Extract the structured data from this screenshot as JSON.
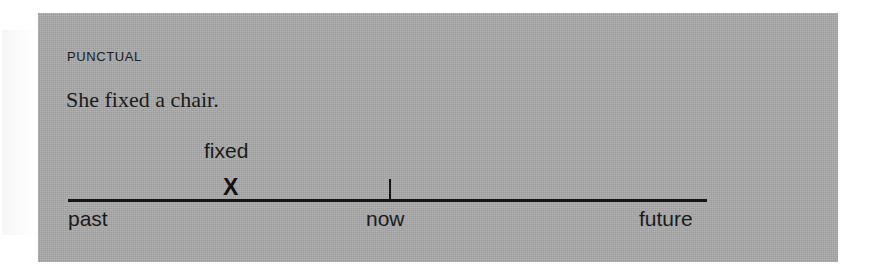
{
  "figure": {
    "aspect_label": "Punctual",
    "example_sentence": "She fixed a chair.",
    "panel_color": "#a9a9a9",
    "ink_color": "#1b1b1b"
  },
  "timeline": {
    "axis": {
      "captions": [
        {
          "id": "past",
          "label": "past"
        },
        {
          "id": "now",
          "label": "now"
        },
        {
          "id": "future",
          "label": "future"
        }
      ],
      "now_tick": true
    },
    "events": [
      {
        "id": "fixed",
        "verb_label": "fixed",
        "marker_glyph": "X",
        "marker_kind": "punctual-point",
        "region": "past"
      }
    ]
  },
  "chart_data": {
    "type": "scatter",
    "title": "Punctual",
    "subtitle": "She fixed a chair.",
    "xlabel": "",
    "ylabel": "",
    "grid": false,
    "legend": null,
    "x_axis": {
      "kind": "timeline",
      "tick_labels": [
        "past",
        "now",
        "future"
      ],
      "tick_positions": [
        0.0,
        0.5,
        1.0
      ],
      "marked_ticks": [
        "now"
      ]
    },
    "series": [
      {
        "name": "fixed",
        "marker": "X",
        "x": [
          0.25
        ],
        "y": [
          0
        ],
        "annotations": [
          "fixed"
        ]
      }
    ]
  }
}
